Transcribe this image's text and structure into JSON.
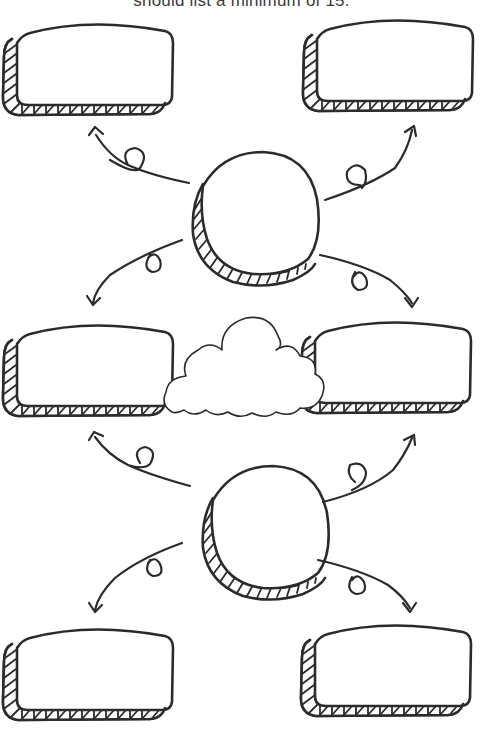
{
  "header": {
    "instruction_text": "should list a minimum of 15."
  },
  "diagram": {
    "type": "mind-map-worksheet",
    "central_nodes": [
      {
        "id": "circle-top",
        "shape": "hatched-circle",
        "label": ""
      },
      {
        "id": "circle-bottom",
        "shape": "hatched-circle",
        "label": ""
      }
    ],
    "boxes": [
      {
        "id": "box-top-left",
        "label": ""
      },
      {
        "id": "box-top-right",
        "label": ""
      },
      {
        "id": "box-middle-left",
        "label": ""
      },
      {
        "id": "box-middle-right",
        "label": ""
      },
      {
        "id": "box-bottom-left",
        "label": ""
      },
      {
        "id": "box-bottom-right",
        "label": ""
      }
    ],
    "cloud": {
      "id": "cloud-center",
      "label": ""
    },
    "arrows": [
      {
        "from": "circle-top",
        "to": "box-top-left",
        "style": "looped-curve"
      },
      {
        "from": "circle-top",
        "to": "box-top-right",
        "style": "looped-curve"
      },
      {
        "from": "circle-top",
        "to": "box-middle-left",
        "style": "looped-curve"
      },
      {
        "from": "circle-top",
        "to": "box-middle-right",
        "style": "looped-curve"
      },
      {
        "from": "circle-bottom",
        "to": "box-middle-left",
        "style": "looped-curve"
      },
      {
        "from": "circle-bottom",
        "to": "box-middle-right",
        "style": "looped-curve"
      },
      {
        "from": "circle-bottom",
        "to": "box-bottom-left",
        "style": "looped-curve"
      },
      {
        "from": "circle-bottom",
        "to": "box-bottom-right",
        "style": "looped-curve"
      }
    ],
    "colors": {
      "ink": "#2b2b2b",
      "background": "#ffffff"
    }
  }
}
